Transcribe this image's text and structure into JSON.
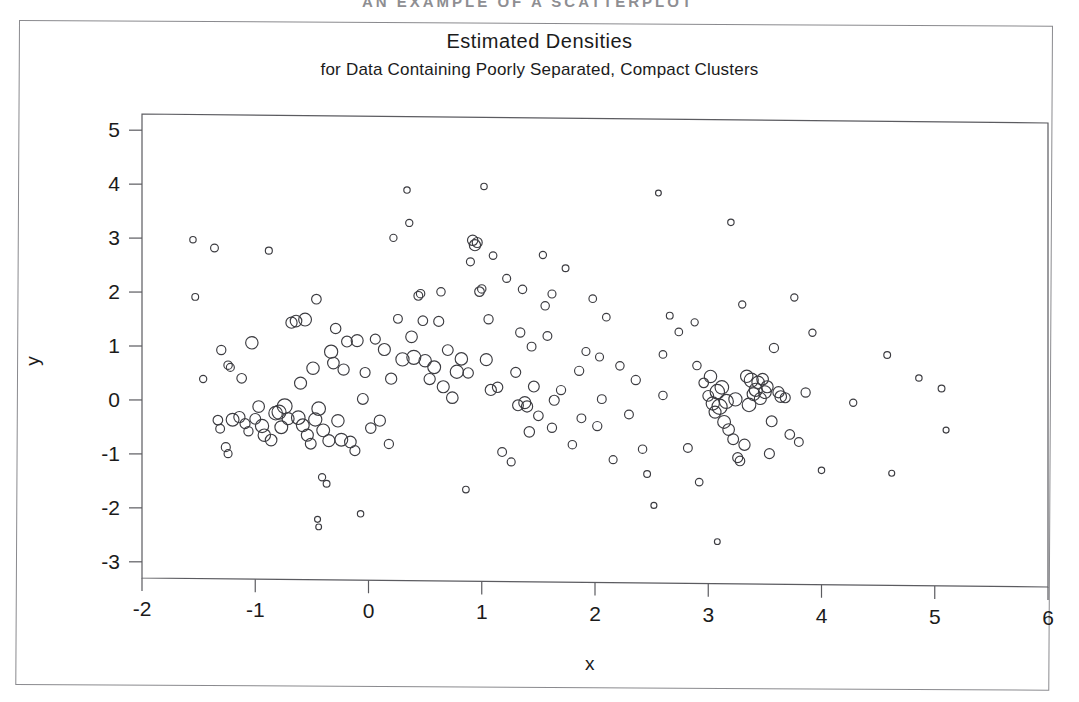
{
  "page": {
    "scan_header": "AN EXAMPLE OF A SCATTERPLOT",
    "background_color": "#ffffff",
    "frame_color": "#8a8a8e"
  },
  "chart_data": {
    "type": "scatter",
    "title": "Estimated Densities",
    "subtitle": "for Data Containing Poorly Separated, Compact Clusters",
    "xlabel": "x",
    "ylabel": "y",
    "marker": "open-circle",
    "marker_encoding": "radius proportional to estimated density",
    "marker_color": "#3c3c41",
    "grid": false,
    "legend": null,
    "xlim": [
      -2,
      6
    ],
    "ylim": [
      -3.3,
      5.3
    ],
    "xticks": [
      -2,
      -1,
      0,
      1,
      2,
      3,
      4,
      5,
      6
    ],
    "yticks": [
      -3,
      -2,
      -1,
      0,
      1,
      2,
      3,
      4,
      5
    ],
    "xtick_labels": [
      "-2",
      "-1",
      "0",
      "1",
      "2",
      "3",
      "4",
      "5",
      "6"
    ],
    "ytick_labels": [
      "-3",
      "-2",
      "-1",
      "0",
      "1",
      "2",
      "3",
      "4",
      "5"
    ],
    "n_points": 186,
    "points": [
      [
        -1.55,
        2.98,
        3.2
      ],
      [
        -1.53,
        1.92,
        3.4
      ],
      [
        -1.46,
        0.4,
        3.6
      ],
      [
        -1.36,
        2.83,
        3.9
      ],
      [
        -1.3,
        0.94,
        4.6
      ],
      [
        -1.24,
        0.66,
        4.2
      ],
      [
        -1.22,
        0.62,
        4.0
      ],
      [
        -1.33,
        -0.36,
        4.8
      ],
      [
        -1.31,
        -0.52,
        4.4
      ],
      [
        -1.26,
        -0.86,
        4.5
      ],
      [
        -1.24,
        -0.98,
        4.0
      ],
      [
        -1.2,
        -0.35,
        6.4
      ],
      [
        -1.14,
        -0.3,
        5.6
      ],
      [
        -1.09,
        -0.42,
        5.0
      ],
      [
        -1.06,
        -0.56,
        4.6
      ],
      [
        -1.03,
        1.08,
        6.2
      ],
      [
        -1.0,
        -0.33,
        5.4
      ],
      [
        -0.97,
        -0.1,
        5.8
      ],
      [
        -0.94,
        -0.46,
        6.6
      ],
      [
        -0.92,
        -0.63,
        6.2
      ],
      [
        -0.88,
        2.79,
        3.5
      ],
      [
        -0.86,
        -0.72,
        5.8
      ],
      [
        -0.82,
        -0.22,
        6.8
      ],
      [
        -0.79,
        -0.2,
        7.0
      ],
      [
        -0.77,
        -0.48,
        6.4
      ],
      [
        -0.74,
        -0.09,
        7.4
      ],
      [
        -0.71,
        -0.32,
        6.0
      ],
      [
        -0.68,
        1.46,
        5.6
      ],
      [
        -0.64,
        1.49,
        5.8
      ],
      [
        -0.62,
        -0.3,
        6.8
      ],
      [
        -0.58,
        -0.44,
        6.4
      ],
      [
        -0.56,
        1.52,
        6.4
      ],
      [
        -0.54,
        -0.62,
        6.0
      ],
      [
        -0.51,
        -0.78,
        5.4
      ],
      [
        -0.49,
        0.62,
        6.2
      ],
      [
        -0.47,
        -0.33,
        6.6
      ],
      [
        -0.46,
        1.9,
        4.8
      ],
      [
        -0.44,
        -0.13,
        6.8
      ],
      [
        -0.41,
        -1.4,
        3.6
      ],
      [
        -0.4,
        -0.53,
        6.4
      ],
      [
        -0.37,
        -1.52,
        3.4
      ],
      [
        -0.35,
        -0.72,
        6.0
      ],
      [
        -0.33,
        0.93,
        6.6
      ],
      [
        -0.31,
        0.72,
        5.8
      ],
      [
        -0.29,
        1.36,
        5.2
      ],
      [
        -0.27,
        -0.35,
        6.2
      ],
      [
        -0.24,
        -0.7,
        6.4
      ],
      [
        -0.22,
        0.6,
        5.6
      ],
      [
        -0.19,
        1.12,
        5.4
      ],
      [
        -0.16,
        -0.74,
        5.8
      ],
      [
        -0.12,
        -0.9,
        5.0
      ],
      [
        -0.1,
        1.14,
        6.0
      ],
      [
        -0.07,
        -2.07,
        3.2
      ],
      [
        -0.05,
        0.06,
        5.4
      ],
      [
        -0.03,
        0.55,
        5.0
      ],
      [
        -0.45,
        -2.18,
        3.0
      ],
      [
        -0.44,
        -2.32,
        2.9
      ],
      [
        0.02,
        -0.48,
        5.2
      ],
      [
        0.06,
        1.17,
        5.0
      ],
      [
        0.1,
        -0.34,
        5.6
      ],
      [
        0.14,
        0.98,
        6.0
      ],
      [
        0.18,
        -0.77,
        4.6
      ],
      [
        0.22,
        3.05,
        3.6
      ],
      [
        0.26,
        1.55,
        4.4
      ],
      [
        0.3,
        0.8,
        6.6
      ],
      [
        0.34,
        3.94,
        3.2
      ],
      [
        0.36,
        3.33,
        3.6
      ],
      [
        0.38,
        1.22,
        5.8
      ],
      [
        0.4,
        0.84,
        7.0
      ],
      [
        0.44,
        1.98,
        4.4
      ],
      [
        0.46,
        2.02,
        4.2
      ],
      [
        0.48,
        1.52,
        4.8
      ],
      [
        0.5,
        0.78,
        6.2
      ],
      [
        0.54,
        0.44,
        5.6
      ],
      [
        0.58,
        0.66,
        6.4
      ],
      [
        0.62,
        1.51,
        5.0
      ],
      [
        0.66,
        0.3,
        6.0
      ],
      [
        0.7,
        0.98,
        5.4
      ],
      [
        0.74,
        0.1,
        5.8
      ],
      [
        0.78,
        0.58,
        6.6
      ],
      [
        0.82,
        0.82,
        6.2
      ],
      [
        0.86,
        -1.6,
        3.3
      ],
      [
        0.9,
        2.62,
        4.0
      ],
      [
        0.92,
        3.02,
        5.2
      ],
      [
        0.94,
        2.93,
        5.6
      ],
      [
        0.96,
        2.98,
        5.0
      ],
      [
        0.98,
        2.07,
        4.8
      ],
      [
        1.0,
        2.12,
        4.2
      ],
      [
        1.02,
        4.02,
        3.2
      ],
      [
        1.04,
        0.81,
        6.0
      ],
      [
        1.06,
        1.56,
        4.6
      ],
      [
        1.08,
        0.25,
        5.6
      ],
      [
        1.1,
        2.74,
        3.8
      ],
      [
        1.14,
        0.3,
        5.2
      ],
      [
        1.18,
        -0.9,
        4.4
      ],
      [
        1.22,
        2.32,
        4.0
      ],
      [
        1.26,
        -1.08,
        4.0
      ],
      [
        1.3,
        0.58,
        5.0
      ],
      [
        1.32,
        -0.03,
        5.4
      ],
      [
        1.34,
        1.32,
        4.6
      ],
      [
        1.36,
        2.12,
        4.2
      ],
      [
        1.38,
        0.02,
        6.0
      ],
      [
        1.4,
        -0.05,
        5.6
      ],
      [
        1.42,
        -0.52,
        5.2
      ],
      [
        1.46,
        0.32,
        5.4
      ],
      [
        1.5,
        -0.22,
        4.8
      ],
      [
        1.54,
        2.76,
        3.6
      ],
      [
        1.56,
        1.82,
        4.2
      ],
      [
        1.58,
        1.26,
        4.4
      ],
      [
        1.62,
        2.04,
        4.0
      ],
      [
        1.64,
        0.07,
        5.0
      ],
      [
        1.7,
        0.26,
        4.6
      ],
      [
        1.74,
        2.52,
        3.4
      ],
      [
        1.8,
        -0.75,
        4.2
      ],
      [
        1.86,
        0.62,
        4.6
      ],
      [
        1.92,
        0.98,
        4.0
      ],
      [
        1.98,
        1.96,
        3.8
      ],
      [
        2.02,
        -0.4,
        4.6
      ],
      [
        2.06,
        0.1,
        4.4
      ],
      [
        2.1,
        1.62,
        3.8
      ],
      [
        2.16,
        -1.02,
        4.0
      ],
      [
        2.22,
        0.72,
        4.2
      ],
      [
        2.3,
        -0.18,
        4.4
      ],
      [
        2.36,
        0.46,
        4.6
      ],
      [
        2.42,
        -0.82,
        4.2
      ],
      [
        2.46,
        -1.28,
        3.4
      ],
      [
        2.52,
        -1.86,
        3.0
      ],
      [
        2.56,
        3.93,
        2.9
      ],
      [
        2.6,
        0.18,
        4.2
      ],
      [
        2.66,
        1.66,
        3.4
      ],
      [
        2.74,
        1.36,
        3.8
      ],
      [
        2.82,
        -0.79,
        4.4
      ],
      [
        2.88,
        1.54,
        3.6
      ],
      [
        2.92,
        -1.42,
        3.8
      ],
      [
        2.96,
        0.42,
        4.8
      ],
      [
        3.0,
        0.18,
        5.4
      ],
      [
        3.02,
        0.54,
        6.2
      ],
      [
        3.04,
        0.04,
        6.6
      ],
      [
        3.06,
        -0.12,
        6.0
      ],
      [
        3.08,
        0.26,
        7.2
      ],
      [
        3.08,
        -2.52,
        2.9
      ],
      [
        3.1,
        -0.02,
        7.6
      ],
      [
        3.12,
        0.34,
        6.8
      ],
      [
        3.14,
        -0.3,
        6.4
      ],
      [
        3.16,
        0.08,
        7.0
      ],
      [
        3.18,
        -0.44,
        5.8
      ],
      [
        3.2,
        3.4,
        3.2
      ],
      [
        3.22,
        -0.62,
        5.4
      ],
      [
        3.24,
        0.12,
        6.6
      ],
      [
        3.26,
        -0.96,
        5.0
      ],
      [
        3.28,
        -1.02,
        4.8
      ],
      [
        3.3,
        1.88,
        3.6
      ],
      [
        3.32,
        -0.72,
        5.6
      ],
      [
        3.34,
        0.55,
        6.2
      ],
      [
        3.36,
        0.02,
        6.8
      ],
      [
        3.38,
        0.48,
        7.0
      ],
      [
        3.4,
        0.22,
        6.4
      ],
      [
        3.42,
        0.3,
        6.6
      ],
      [
        3.44,
        0.44,
        6.2
      ],
      [
        3.46,
        0.14,
        6.0
      ],
      [
        3.48,
        0.5,
        5.8
      ],
      [
        3.5,
        0.26,
        6.4
      ],
      [
        3.52,
        0.36,
        6.0
      ],
      [
        3.56,
        -0.28,
        5.4
      ],
      [
        3.58,
        1.08,
        4.6
      ],
      [
        3.62,
        0.26,
        5.6
      ],
      [
        3.64,
        0.18,
        5.8
      ],
      [
        3.68,
        0.16,
        5.0
      ],
      [
        3.72,
        -0.52,
        4.8
      ],
      [
        3.76,
        2.02,
        3.6
      ],
      [
        3.8,
        -0.66,
        4.4
      ],
      [
        3.86,
        0.26,
        4.6
      ],
      [
        3.92,
        1.37,
        3.6
      ],
      [
        4.0,
        -1.18,
        3.2
      ],
      [
        4.28,
        0.08,
        3.6
      ],
      [
        4.58,
        0.97,
        3.4
      ],
      [
        4.62,
        -1.22,
        3.0
      ],
      [
        4.86,
        0.55,
        3.2
      ],
      [
        5.06,
        0.36,
        3.4
      ],
      [
        5.1,
        -0.41,
        3.0
      ],
      [
        0.88,
        0.56,
        5.2
      ],
      [
        1.44,
        1.06,
        4.4
      ],
      [
        2.04,
        0.88,
        4.0
      ],
      [
        -0.6,
        0.34,
        6.0
      ],
      [
        0.64,
        2.06,
        4.2
      ],
      [
        1.62,
        -0.44,
        4.6
      ],
      [
        2.6,
        0.94,
        3.8
      ],
      [
        3.54,
        -0.88,
        5.0
      ],
      [
        0.2,
        0.44,
        5.6
      ],
      [
        -1.12,
        0.42,
        4.8
      ],
      [
        1.88,
        -0.26,
        4.4
      ],
      [
        2.9,
        0.74,
        4.2
      ]
    ]
  }
}
